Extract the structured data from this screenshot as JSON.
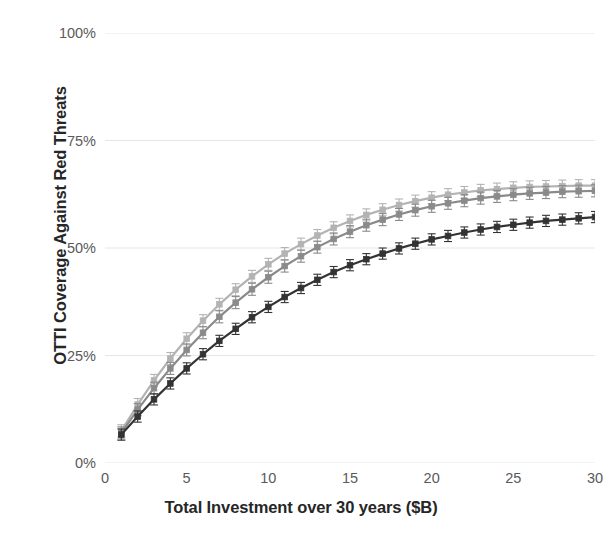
{
  "chart_data": {
    "type": "line",
    "title": "",
    "xlabel": "Total Investment over 30 years ($B)",
    "ylabel": "OTTI Coverage Against Red Threats",
    "xlim": [
      0,
      30
    ],
    "ylim": [
      0,
      100
    ],
    "xticks": [
      0,
      5,
      10,
      15,
      20,
      25,
      30
    ],
    "xtick_labels": [
      "0",
      "5",
      "10",
      "15",
      "20",
      "25",
      "30"
    ],
    "yticks": [
      0,
      25,
      50,
      75,
      100
    ],
    "ytick_labels": [
      "0%",
      "25%",
      "50%",
      "75%",
      "100%"
    ],
    "grid": "horizontal",
    "legend": "none",
    "units": "percent",
    "error_bars": "vertical-capped",
    "x": [
      1,
      2,
      3,
      4,
      5,
      6,
      7,
      8,
      9,
      10,
      11,
      12,
      13,
      14,
      15,
      16,
      17,
      18,
      19,
      20,
      21,
      22,
      23,
      24,
      25,
      26,
      27,
      28,
      29,
      30
    ],
    "series": [
      {
        "name": "Series A",
        "color": "#b3b3b3",
        "marker": "square",
        "values": [
          7.5,
          13.6,
          19.2,
          24.3,
          28.9,
          33.1,
          36.9,
          40.3,
          43.4,
          46.2,
          48.7,
          50.9,
          52.9,
          54.7,
          56.3,
          57.7,
          58.9,
          60.0,
          60.9,
          61.7,
          62.4,
          62.9,
          63.4,
          63.7,
          64.0,
          64.2,
          64.3,
          64.4,
          64.5,
          64.5
        ],
        "errors": [
          1.4,
          1.4,
          1.4,
          1.4,
          1.4,
          1.4,
          1.4,
          1.4,
          1.4,
          1.4,
          1.4,
          1.4,
          1.4,
          1.4,
          1.4,
          1.4,
          1.4,
          1.4,
          1.4,
          1.4,
          1.4,
          1.4,
          1.4,
          1.4,
          1.4,
          1.4,
          1.4,
          1.4,
          1.4,
          1.4
        ]
      },
      {
        "name": "Series B",
        "color": "#8a8a8a",
        "marker": "square",
        "values": [
          7.0,
          12.4,
          17.4,
          22.0,
          26.3,
          30.3,
          34.0,
          37.3,
          40.4,
          43.2,
          45.8,
          48.1,
          50.2,
          52.1,
          53.8,
          55.3,
          56.6,
          57.8,
          58.8,
          59.7,
          60.4,
          61.0,
          61.6,
          62.0,
          62.4,
          62.7,
          62.9,
          63.1,
          63.2,
          63.3
        ],
        "errors": [
          1.4,
          1.4,
          1.4,
          1.4,
          1.4,
          1.4,
          1.4,
          1.4,
          1.4,
          1.4,
          1.4,
          1.4,
          1.4,
          1.4,
          1.4,
          1.4,
          1.4,
          1.4,
          1.4,
          1.4,
          1.4,
          1.4,
          1.4,
          1.4,
          1.4,
          1.4,
          1.4,
          1.4,
          1.4,
          1.4
        ]
      },
      {
        "name": "Series C",
        "color": "#333333",
        "marker": "square",
        "values": [
          6.6,
          10.8,
          14.8,
          18.5,
          22.0,
          25.3,
          28.4,
          31.2,
          33.9,
          36.3,
          38.6,
          40.7,
          42.6,
          44.4,
          46.0,
          47.4,
          48.7,
          49.9,
          51.0,
          52.0,
          52.8,
          53.6,
          54.3,
          54.9,
          55.4,
          55.9,
          56.3,
          56.6,
          56.9,
          57.2
        ]
      }
    ]
  },
  "axis": {
    "y_title": "OTTI Coverage Against Red Threats",
    "x_title": "Total Investment over 30 years ($B)"
  }
}
